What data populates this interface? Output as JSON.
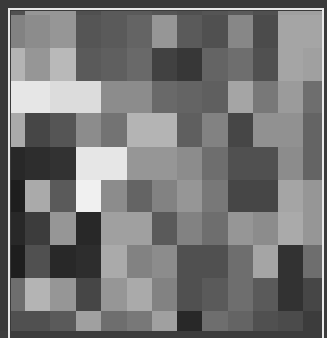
{
  "image": {
    "description": "Pixelated grayscale mosaic image with a thin white frame",
    "width": 327,
    "height": 331,
    "frame_color": "#3a3a3a",
    "border_color": "#e8e8e8",
    "grid": {
      "col_edges": [
        0,
        14,
        39,
        65,
        90,
        116,
        141,
        166,
        191,
        217,
        242,
        267,
        292,
        311
      ],
      "row_edges": [
        0,
        4,
        37,
        70,
        102,
        136,
        169,
        201,
        234,
        267,
        300,
        320
      ],
      "gray": [
        [
          80,
          150,
          150,
          80,
          90,
          90,
          85,
          80,
          85,
          90,
          80,
          160,
          160
        ],
        [
          130,
          140,
          150,
          85,
          90,
          100,
          150,
          90,
          80,
          135,
          75,
          165,
          165
        ],
        [
          180,
          150,
          185,
          90,
          95,
          105,
          65,
          55,
          100,
          110,
          80,
          165,
          160
        ],
        [
          230,
          230,
          220,
          220,
          140,
          140,
          105,
          100,
          95,
          165,
          120,
          155,
          110
        ],
        [
          170,
          70,
          85,
          140,
          115,
          180,
          180,
          95,
          130,
          70,
          145,
          145,
          100
        ],
        [
          40,
          45,
          50,
          230,
          230,
          150,
          150,
          140,
          110,
          80,
          80,
          140,
          100
        ],
        [
          30,
          170,
          90,
          240,
          140,
          100,
          130,
          150,
          120,
          70,
          70,
          165,
          150
        ],
        [
          40,
          60,
          150,
          40,
          160,
          160,
          90,
          130,
          110,
          150,
          140,
          170,
          150
        ],
        [
          30,
          80,
          40,
          45,
          170,
          130,
          140,
          80,
          80,
          110,
          165,
          50,
          110
        ],
        [
          110,
          180,
          150,
          70,
          150,
          170,
          130,
          80,
          90,
          110,
          90,
          50,
          70
        ],
        [
          80,
          80,
          90,
          160,
          110,
          120,
          160,
          40,
          110,
          100,
          80,
          75,
          60
        ]
      ]
    }
  }
}
